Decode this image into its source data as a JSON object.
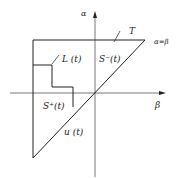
{
  "diagram": {
    "axes": {
      "vertical_label": "α",
      "horizontal_label": "β"
    },
    "labels": {
      "T": "T",
      "diag": "α=β",
      "L": "L (t)",
      "S_minus": "S⁻(t)",
      "S_plus": "S⁺(t)",
      "u": "u (t)"
    },
    "colors": {
      "line": "#222222",
      "axis": "#555555"
    }
  }
}
